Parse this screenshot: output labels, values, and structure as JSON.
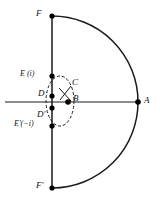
{
  "figure": {
    "type": "geometric-construction",
    "canvas": {
      "width": 160,
      "height": 204,
      "background": "#ffffff"
    },
    "stroke_color": "#1a1a1a",
    "point_color": "#000000",
    "labels": {
      "F_top": "F",
      "F_bottom": "F'",
      "E_upper": "E (i)",
      "E_lower": "E'(−i)",
      "D_upper": "D",
      "D_lower": "D'",
      "B": "B",
      "C": "C",
      "A": "A"
    },
    "points": [
      {
        "id": "F",
        "label": "F",
        "x": 52,
        "y": 16
      },
      {
        "id": "E",
        "label": "E (i)",
        "x": 52,
        "y": 76
      },
      {
        "id": "D",
        "label": "D",
        "x": 52,
        "y": 96
      },
      {
        "id": "Dp",
        "label": "D'",
        "x": 52,
        "y": 108
      },
      {
        "id": "Ep",
        "label": "E'(−i)",
        "x": 52,
        "y": 126
      },
      {
        "id": "Fp",
        "label": "F'",
        "x": 52,
        "y": 188
      },
      {
        "id": "B",
        "label": "B",
        "x": 68,
        "y": 102
      },
      {
        "id": "A",
        "label": "A",
        "x": 138,
        "y": 102
      }
    ],
    "lines": {
      "vertical_axis": {
        "x1": 52,
        "y1": 16,
        "x2": 52,
        "y2": 188
      },
      "horizontal_axis": {
        "x1": 5,
        "y1": 102,
        "x2": 140,
        "y2": 102
      }
    },
    "arc": {
      "kind": "semicircle",
      "from": "F",
      "to": "F'",
      "through": "A",
      "center_x": 52,
      "center_y": 102,
      "radius": 86,
      "bulge": "right"
    },
    "dashed_circle": {
      "center_x": 60,
      "center_y": 101,
      "radius_x": 14,
      "radius_y": 25,
      "dash": "3 2"
    },
    "cross_marks": {
      "label": "C",
      "x": 65,
      "y": 95
    }
  }
}
